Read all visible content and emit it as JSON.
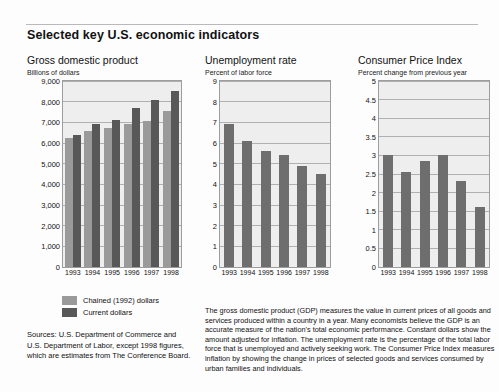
{
  "page": {
    "title": "Selected key U.S. economic indicators"
  },
  "charts": [
    {
      "key": "gdp",
      "title": "Gross domestic product",
      "subtitle": "Billions of dollars",
      "type": "bar",
      "categories": [
        "1993",
        "1994",
        "1995",
        "1996",
        "1997",
        "1998"
      ],
      "yticks": [
        "0",
        "1,000",
        "2,000",
        "3,000",
        "4,000",
        "5,000",
        "6,000",
        "7,000",
        "8,000",
        "9,000"
      ],
      "ylim": [
        0,
        9000
      ],
      "series": [
        {
          "name": "Chained (1992) dollars",
          "color": "#9a9a9a",
          "values": [
            6250,
            6600,
            6750,
            6900,
            7050,
            7550
          ]
        },
        {
          "name": "Current dollars",
          "color": "#585858",
          "values": [
            6400,
            6900,
            7100,
            7700,
            8100,
            8500
          ]
        }
      ]
    },
    {
      "key": "unemployment",
      "title": "Unemployment rate",
      "subtitle": "Percent of labor force",
      "type": "bar",
      "categories": [
        "1993",
        "1994",
        "1995",
        "1996",
        "1997",
        "1998"
      ],
      "yticks": [
        "0",
        "1",
        "2",
        "3",
        "4",
        "5",
        "6",
        "7",
        "8",
        "9"
      ],
      "ylim": [
        0,
        9
      ],
      "series": [
        {
          "name": "Unemployment rate",
          "color": "#6e6e6e",
          "values": [
            6.9,
            6.1,
            5.6,
            5.4,
            4.9,
            4.5
          ]
        }
      ]
    },
    {
      "key": "cpi",
      "title": "Consumer Price Index",
      "subtitle": "Percent change from previous year",
      "type": "bar",
      "categories": [
        "1993",
        "1994",
        "1995",
        "1996",
        "1997",
        "1998"
      ],
      "yticks": [
        "0",
        "0.5",
        "1",
        "1.5",
        "2",
        "2.5",
        "3",
        "3.5",
        "4",
        "4.5",
        "5"
      ],
      "ylim": [
        0,
        5
      ],
      "series": [
        {
          "name": "Consumer Price Index",
          "color": "#6e6e6e",
          "values": [
            3.0,
            2.55,
            2.85,
            3.0,
            2.3,
            1.6
          ]
        }
      ]
    }
  ],
  "legend": {
    "items": [
      {
        "label": "Chained (1992) dollars",
        "color": "#9a9a9a"
      },
      {
        "label": "Current dollars",
        "color": "#585858"
      }
    ]
  },
  "sources": "Sources: U.S. Department of Commerce and U.S. Department of Labor, except 1998 figures, which are estimates from The Conference Board.",
  "note": "The gross domestic product (GDP) measures the value in current prices of all goods and services produced within a country in a year. Many economists believe the GDP is an accurate measure of the nation's total economic performance. Constant dollars show the amount adjusted for inflation. The unemployment rate is the percentage of the total labor force that is unemployed and actively seeking work. The Consumer Price Index measures inflation by showing the change in prices of selected goods and services consumed by urban families and individuals."
}
